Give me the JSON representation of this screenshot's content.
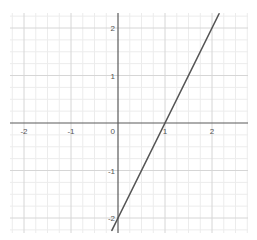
{
  "chart_data": {
    "type": "line",
    "title": "",
    "xlabel": "",
    "ylabel": "",
    "xlim": [
      -2.3,
      2.75
    ],
    "ylim": [
      -2.35,
      2.3
    ],
    "grid": true,
    "minor_grid_step": 0.25,
    "major_grid_step": 1,
    "x_ticks": [
      -2,
      -1,
      0,
      1,
      2
    ],
    "y_ticks": [
      -2,
      -1,
      1,
      2
    ],
    "x_tick_labels": [
      "-2",
      "-1",
      "0",
      "1",
      "2"
    ],
    "y_tick_labels": [
      "-2",
      "-1",
      "1",
      "2"
    ],
    "origin_label": "0",
    "series": [
      {
        "name": "y = 2x - 2",
        "equation": "y = 2x - 2",
        "x": [
          -0.13,
          0,
          1,
          2,
          2.15
        ],
        "y": [
          -2.26,
          -2,
          0,
          2,
          2.3
        ],
        "color": "#555555"
      }
    ],
    "legend": null
  },
  "colors": {
    "axis": "#5a5a5a",
    "major_grid": "#d6d6d6",
    "minor_grid": "#ececec",
    "line": "#555555",
    "background": "#ffffff"
  }
}
